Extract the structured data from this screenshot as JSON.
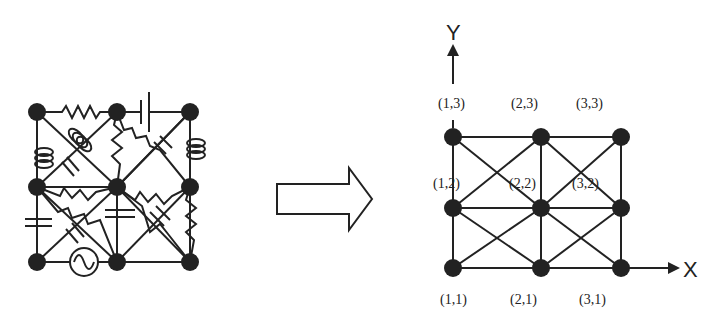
{
  "left_circuit": {
    "description": "Random circuit network on 3x3 node grid with resistors, capacitors, inductors, battery and AC source",
    "nodes": [
      [
        37,
        112
      ],
      [
        117,
        112
      ],
      [
        190,
        112
      ],
      [
        37,
        187
      ],
      [
        117,
        187
      ],
      [
        190,
        187
      ],
      [
        37,
        262
      ],
      [
        117,
        262
      ],
      [
        190,
        262
      ]
    ],
    "components": [
      "resistor",
      "capacitor",
      "inductor",
      "battery",
      "ac-source"
    ]
  },
  "transform_arrow": {
    "label": ""
  },
  "right_lattice": {
    "axes": {
      "x_label": "X",
      "y_label": "Y"
    },
    "node_labels": {
      "n13": "(1,3)",
      "n23": "(2,3)",
      "n33": "(3,3)",
      "n12": "(1,2)",
      "n22": "(2,2)",
      "n32": "(3,2)",
      "n11": "(1,1)",
      "n21": "(2,1)",
      "n31": "(3,1)"
    },
    "columns_x": [
      453,
      541,
      621
    ],
    "rows_y": [
      137,
      208,
      268
    ]
  },
  "colors": {
    "ink": "#222222",
    "background": "#ffffff"
  }
}
